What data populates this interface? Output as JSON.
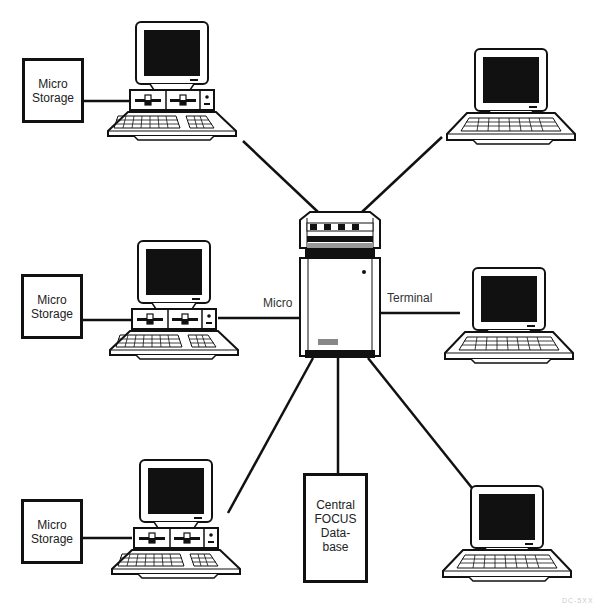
{
  "diagram": {
    "type": "star-network",
    "colors": {
      "ink": "#111111",
      "background": "#ffffff",
      "screen": "#111111"
    },
    "hub": {
      "name": "central-host-computer"
    },
    "storage_boxes": [
      {
        "line1": "Micro",
        "line2": "Storage"
      },
      {
        "line1": "Micro",
        "line2": "Storage"
      },
      {
        "line1": "Micro",
        "line2": "Storage"
      }
    ],
    "database": {
      "line1": "Central",
      "line2": "FOCUS",
      "line3": "Data-",
      "line4": "base"
    },
    "edge_labels": {
      "micro": "Micro",
      "terminal": "Terminal"
    },
    "nodes": [
      {
        "kind": "microcomputer",
        "position": "top-left"
      },
      {
        "kind": "microcomputer",
        "position": "middle-left"
      },
      {
        "kind": "microcomputer",
        "position": "bottom-left"
      },
      {
        "kind": "terminal",
        "position": "top-right"
      },
      {
        "kind": "terminal",
        "position": "middle-right"
      },
      {
        "kind": "terminal",
        "position": "bottom-right"
      }
    ],
    "figure_id": "DC-5XX"
  }
}
